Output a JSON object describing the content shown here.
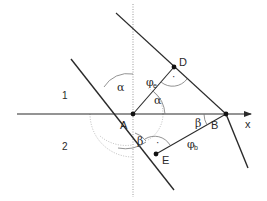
{
  "diagram": {
    "regions": {
      "upper": "1",
      "lower": "2"
    },
    "axis": {
      "label": "x"
    },
    "points": {
      "A": "A",
      "B": "B",
      "D": "D",
      "E": "E"
    },
    "angles": {
      "alpha_top": "α",
      "alpha_mid": "α",
      "beta_left": "β",
      "beta_right": "β",
      "phi_e": "φ",
      "phi_e_sub": "e",
      "phi_b": "φ",
      "phi_b_sub": "b"
    },
    "right_angle_marks": {
      "at_D": "·",
      "at_E": "·"
    },
    "colors": {
      "line": "#2a2a2a",
      "dotted": "#9a9a9a",
      "arc": "#8a8a8a"
    }
  }
}
